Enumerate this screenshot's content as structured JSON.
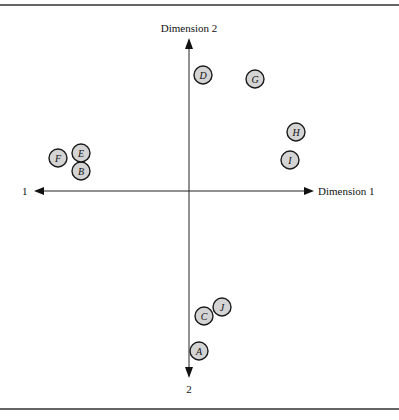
{
  "diagram": {
    "type": "perceptual-map",
    "axes": {
      "horizontal": {
        "positive_label": "Dimension 1",
        "negative_label": "1"
      },
      "vertical": {
        "positive_label": "Dimension 2",
        "negative_label": "2"
      }
    },
    "points": [
      {
        "id": "A",
        "x": 199,
        "y": 351
      },
      {
        "id": "B",
        "x": 81,
        "y": 171
      },
      {
        "id": "C",
        "x": 204,
        "y": 316
      },
      {
        "id": "D",
        "x": 203,
        "y": 75
      },
      {
        "id": "E",
        "x": 81,
        "y": 153
      },
      {
        "id": "F",
        "x": 58,
        "y": 158
      },
      {
        "id": "G",
        "x": 255,
        "y": 79
      },
      {
        "id": "H",
        "x": 296,
        "y": 132
      },
      {
        "id": "I",
        "x": 290,
        "y": 160
      },
      {
        "id": "J",
        "x": 222,
        "y": 307
      }
    ],
    "colors": {
      "point_fill": "#d4d4d4",
      "stroke": "#1a1a1a",
      "rule": "#333333"
    }
  }
}
